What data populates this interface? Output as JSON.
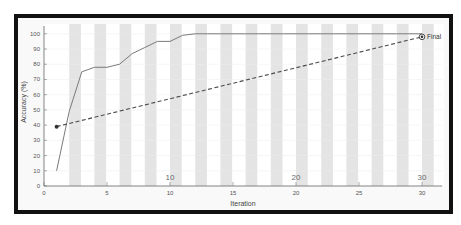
{
  "chart_data": {
    "type": "line",
    "title": "",
    "xlabel": "Iteration",
    "ylabel": "Accuracy (%)",
    "xlim": [
      0,
      31.6
    ],
    "ylim": [
      0,
      105
    ],
    "xticks": [
      0,
      5,
      10,
      15,
      20,
      25,
      30
    ],
    "yticks": [
      0,
      10,
      20,
      30,
      40,
      50,
      60,
      70,
      80,
      90,
      100
    ],
    "grid": false,
    "legend": null,
    "background_bands": {
      "start": 2,
      "end": 30,
      "step": 2,
      "width": 0.93,
      "color": "#e4e4e4"
    },
    "series": [
      {
        "name": "Accuracy",
        "style": "solid",
        "color": "#7a7a7a",
        "x": [
          1,
          2,
          3,
          4,
          5,
          6,
          7,
          8,
          9,
          10,
          11,
          12,
          13,
          14,
          15,
          16,
          17,
          18,
          19,
          20,
          21,
          22,
          23,
          24,
          25,
          26,
          27,
          28,
          29,
          30
        ],
        "values": [
          10,
          49,
          75,
          78,
          78,
          80,
          87,
          91,
          95,
          95,
          99,
          100,
          100,
          100,
          100,
          100,
          100,
          100,
          100,
          100,
          100,
          100,
          100,
          100,
          100,
          100,
          100,
          100,
          100,
          100
        ]
      },
      {
        "name": "Start-to-final trend",
        "style": "dashed",
        "color": "#4a4a4a",
        "x": [
          1,
          30
        ],
        "values": [
          39,
          98
        ]
      }
    ],
    "annotations": [
      {
        "text": "Final",
        "x": 30,
        "y": 98,
        "marker": "circled-dot"
      },
      {
        "text": "10",
        "x": 10,
        "placement": "inside-above-axis"
      },
      {
        "text": "20",
        "x": 20,
        "placement": "inside-above-axis"
      },
      {
        "text": "30",
        "x": 30,
        "placement": "inside-above-axis"
      }
    ]
  }
}
